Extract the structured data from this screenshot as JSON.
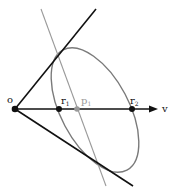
{
  "diagram": {
    "colors": {
      "background": "#ffffff",
      "black": "#111111",
      "gray_line": "#9a9a9a",
      "ellipse": "#7a7a7a",
      "p_point": "#9a9a9a"
    },
    "points": {
      "o": {
        "label": "o",
        "x": 15,
        "y": 109
      },
      "r1": {
        "label": "r",
        "sub": "1",
        "x": 59,
        "y": 109
      },
      "p1": {
        "label": "p",
        "sub": "1",
        "x": 77,
        "y": 109
      },
      "r2": {
        "label": "r",
        "sub": "2",
        "x": 132,
        "y": 109
      }
    },
    "axis": {
      "label": "v",
      "from": [
        15,
        109
      ],
      "to": [
        157,
        109
      ]
    },
    "tangent_upper": {
      "from": [
        15,
        109
      ],
      "to": [
        96,
        9
      ]
    },
    "tangent_lower": {
      "from": [
        15,
        109
      ],
      "to": [
        133,
        186
      ]
    },
    "gray_line": {
      "from": [
        41,
        9
      ],
      "to": [
        106,
        186
      ]
    },
    "ellipse": {
      "cx": 95,
      "cy": 110,
      "rx": 68,
      "ry": 34,
      "rotation": 62
    }
  }
}
